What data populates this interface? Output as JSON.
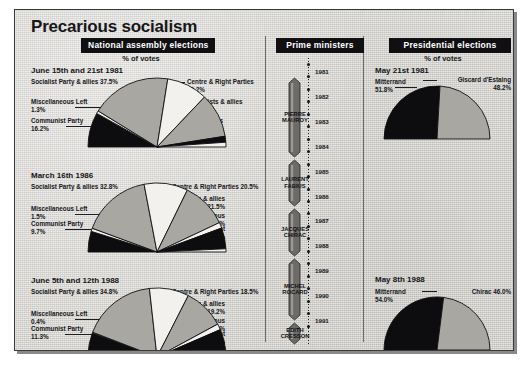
{
  "title": "Precarious socialism",
  "sections": {
    "assembly": {
      "banner": "National assembly elections",
      "caption": "% of votes"
    },
    "pm": {
      "banner": "Prime ministers"
    },
    "presidential": {
      "banner": "Presidential elections",
      "caption": "% of votes"
    }
  },
  "colors": {
    "ink": "#101013",
    "paper": "#d9d7d2",
    "black_slice": "#0d0d10",
    "gray_slice": "#a9a7a2",
    "white_slice": "#f2f1ee",
    "darkgray_slice": "#6d6b67"
  },
  "chart_data": [
    {
      "type": "pie",
      "title": "June 15th and 21st 1981",
      "subtitle": "National assembly elections — % of votes",
      "half": true,
      "legend_position": "callouts",
      "slices": [
        {
          "label": "Communist Party",
          "value": 16.2,
          "value_text": "16.2%",
          "fill": "black"
        },
        {
          "label": "Miscellaneous Left",
          "value": 1.3,
          "value_text": "1.3%",
          "fill": "white"
        },
        {
          "label": "Socialist Party & allies",
          "value": 37.5,
          "value_text": "37.5%",
          "fill": "gray"
        },
        {
          "label": "Centre & Right Parties",
          "value": 19.2,
          "value_text": "19.2%",
          "fill": "white"
        },
        {
          "label": "Gaullists & allies",
          "value": 20.8,
          "value_text": "20.8%",
          "fill": "gray"
        },
        {
          "label": "Miscellaneous Right",
          "value": 2.8,
          "value_text": "2.8%",
          "fill": "black"
        },
        {
          "label": "Other",
          "value": 2.2,
          "value_text": "2.2%",
          "fill": "white"
        }
      ]
    },
    {
      "type": "pie",
      "title": "March 16th 1986",
      "subtitle": "National assembly elections — % of votes",
      "half": true,
      "legend_position": "callouts",
      "slices": [
        {
          "label": "Communist Party",
          "value": 9.7,
          "value_text": "9.7%",
          "fill": "black"
        },
        {
          "label": "Miscellaneous Left",
          "value": 1.5,
          "value_text": "1.5%",
          "fill": "white"
        },
        {
          "label": "Socialist Party & allies",
          "value": 32.8,
          "value_text": "32.8%",
          "fill": "gray"
        },
        {
          "label": "Centre & Right Parties",
          "value": 20.5,
          "value_text": "20.5%",
          "fill": "white"
        },
        {
          "label": "Gaullists & allies",
          "value": 21.5,
          "value_text": "21.5%",
          "fill": "gray"
        },
        {
          "label": "Miscellaneous Right",
          "value": 2.7,
          "value_text": "2.7%",
          "fill": "white"
        },
        {
          "label": "National Front",
          "value": 9.8,
          "value_text": "9.8%",
          "fill": "black"
        },
        {
          "label": "Other",
          "value": 1.5,
          "value_text": "1.5%",
          "fill": "white"
        }
      ]
    },
    {
      "type": "pie",
      "title": "June 5th and 12th 1988",
      "subtitle": "National assembly elections — % of votes",
      "half": true,
      "legend_position": "callouts",
      "slices": [
        {
          "label": "Communist Party",
          "value": 11.3,
          "value_text": "11.3%",
          "fill": "black"
        },
        {
          "label": "Miscellaneous Left",
          "value": 0.4,
          "value_text": "0.4%",
          "fill": "white"
        },
        {
          "label": "Socialist Party & allies",
          "value": 34.8,
          "value_text": "34.8%",
          "fill": "gray"
        },
        {
          "label": "Centre & Right Parties",
          "value": 18.5,
          "value_text": "18.5%",
          "fill": "white"
        },
        {
          "label": "Gaullists & allies",
          "value": 19.2,
          "value_text": "19.2%",
          "fill": "gray"
        },
        {
          "label": "Miscellaneous Right",
          "value": 2.8,
          "value_text": "2.8%",
          "fill": "white"
        },
        {
          "label": "National Front",
          "value": 9.7,
          "value_text": "9.7%",
          "fill": "black"
        },
        {
          "label": "Other",
          "value": 3.3,
          "value_text": "3.3%",
          "fill": "white"
        }
      ]
    },
    {
      "type": "pie",
      "title": "May 21st 1981",
      "subtitle": "Presidential elections — % of votes",
      "half": true,
      "legend_position": "callouts",
      "slices": [
        {
          "label": "Mitterrand",
          "value": 51.8,
          "value_text": "51.8%",
          "fill": "black"
        },
        {
          "label": "Giscard d'Estaing",
          "value": 48.2,
          "value_text": "48.2%",
          "fill": "gray"
        }
      ]
    },
    {
      "type": "pie",
      "title": "May 8th 1988",
      "subtitle": "Presidential elections — % of votes",
      "half": true,
      "legend_position": "callouts",
      "slices": [
        {
          "label": "Mitterrand",
          "value": 54.0,
          "value_text": "54.0%",
          "fill": "black"
        },
        {
          "label": "Chirac",
          "value": 46.0,
          "value_text": "46.0%",
          "fill": "gray"
        }
      ]
    }
  ],
  "assembly_charts": [
    {
      "date": "June 15th and 21st 1981",
      "left": [
        {
          "name": "Socialist Party & allies",
          "pct": "37.5%",
          "inline": true
        },
        {
          "name": "Miscellaneous Left",
          "pct": "1.3%",
          "inline": false
        },
        {
          "name": "Communist Party",
          "pct": "16.2%",
          "inline": false
        }
      ],
      "right": [
        {
          "name": "Centre & Right Parties",
          "pct": "19.2%",
          "inline": false
        },
        {
          "name": "Gaullists & allies",
          "pct": "20.8%",
          "inline": false
        },
        {
          "name": "Miscellaneous",
          "pct": "Right 2.8%",
          "inline": false
        },
        {
          "name": "Other 2.2%",
          "pct": "",
          "inline": true
        }
      ]
    },
    {
      "date": "March 16th 1986",
      "left": [
        {
          "name": "Socialist Party & allies",
          "pct": "32.8%",
          "inline": true
        },
        {
          "name": "Miscellaneous Left",
          "pct": "1.5%",
          "inline": false
        },
        {
          "name": "Communist Party",
          "pct": "9.7%",
          "inline": false
        }
      ],
      "right": [
        {
          "name": "Centre & Right Parties 20.5%",
          "pct": "",
          "inline": true
        },
        {
          "name": "Gaullists & allies",
          "pct": "21.5%",
          "inline": false
        },
        {
          "name": "Miscellaneous",
          "pct": "Right 2.7%",
          "inline": false
        },
        {
          "name": "National Front",
          "pct": "9.8%",
          "inline": false
        },
        {
          "name": "Other 1.5%",
          "pct": "",
          "inline": true
        }
      ]
    },
    {
      "date": "June 5th and 12th 1988",
      "left": [
        {
          "name": "Socialist Party & allies",
          "pct": "34.8%",
          "inline": true
        },
        {
          "name": "Miscellaneous Left",
          "pct": "0.4%",
          "inline": false
        },
        {
          "name": "Communist Party",
          "pct": "11.3%",
          "inline": false
        }
      ],
      "right": [
        {
          "name": "Centre & Right Parties 18.5%",
          "pct": "",
          "inline": true
        },
        {
          "name": "Gaullists & allies",
          "pct": "19.2%",
          "inline": false
        },
        {
          "name": "Miscellaneous",
          "pct": "Right 2.8%",
          "inline": false
        },
        {
          "name": "National Front",
          "pct": "9.7%",
          "inline": false
        },
        {
          "name": "Other 3.3%",
          "pct": "",
          "inline": true
        }
      ]
    }
  ],
  "presidential_charts": [
    {
      "date": "May 21st 1981",
      "left_name": "Mitterrand",
      "left_pct": "51.8%",
      "right_name": "Giscard d'Estaing",
      "right_pct": "48.2%"
    },
    {
      "date": "May 8th 1988",
      "left_name": "Mitterrand",
      "left_pct": "54.0%",
      "right_name": "Chirac 46.0%",
      "right_pct": ""
    }
  ],
  "timeline": {
    "years": [
      "1981",
      "1982",
      "1983",
      "1984",
      "1985",
      "1986",
      "1987",
      "1988",
      "1989",
      "1990",
      "1991"
    ],
    "prime_ministers": [
      {
        "line1": "PIERRE",
        "line2": "MAUROY"
      },
      {
        "line1": "LAURENT",
        "line2": "FABIUS"
      },
      {
        "line1": "JACQUES",
        "line2": "CHIRAC"
      },
      {
        "line1": "MICHEL",
        "line2": "ROCARD"
      },
      {
        "line1": "EDITH",
        "line2": "CRESSON"
      }
    ]
  }
}
